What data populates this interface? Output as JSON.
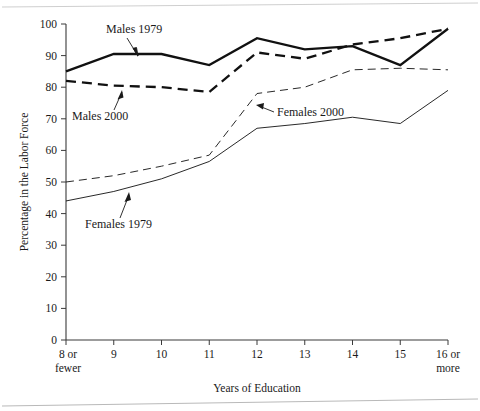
{
  "chart_data": {
    "type": "line",
    "title": "",
    "xlabel": "Years of Education",
    "ylabel": "Percentage in the Labor Force",
    "categories": [
      "8 or fewer",
      "9",
      "10",
      "11",
      "12",
      "13",
      "14",
      "15",
      "16 or more"
    ],
    "x_tick_labels_line1": [
      "8 or",
      "9",
      "10",
      "11",
      "12",
      "13",
      "14",
      "15",
      "16 or"
    ],
    "x_tick_labels_line2": [
      "fewer",
      "",
      "",
      "",
      "",
      "",
      "",
      "",
      "more"
    ],
    "y_tick_labels": [
      "0",
      "10",
      "20",
      "30",
      "40",
      "50",
      "60",
      "70",
      "80",
      "90",
      "100"
    ],
    "y_ticks": [
      0,
      10,
      20,
      30,
      40,
      50,
      60,
      70,
      80,
      90,
      100
    ],
    "ylim": [
      0,
      100
    ],
    "grid": false,
    "legend": "inline-annotations",
    "series": [
      {
        "name": "Males 1979",
        "style": "solid-thick",
        "values": [
          85,
          90.5,
          90.5,
          87,
          95.5,
          92,
          93,
          87,
          98.5
        ]
      },
      {
        "name": "Males 2000",
        "style": "dashed-thick",
        "values": [
          82,
          80.5,
          80,
          78.5,
          91,
          89,
          93.5,
          95.5,
          98.5
        ]
      },
      {
        "name": "Females 2000",
        "style": "dashed-thin",
        "values": [
          50,
          52,
          55,
          58.5,
          78,
          80,
          85.5,
          86,
          85.5
        ]
      },
      {
        "name": "Females 1979",
        "style": "solid-thin",
        "values": [
          44,
          47,
          51,
          56.5,
          67,
          68.5,
          70.5,
          68.5,
          79
        ]
      }
    ],
    "annotations": [
      {
        "text": "Males 1979",
        "series": "Males 1979"
      },
      {
        "text": "Males 2000",
        "series": "Males 2000"
      },
      {
        "text": "Females 2000",
        "series": "Females 2000"
      },
      {
        "text": "Females 1979",
        "series": "Females 1979"
      }
    ]
  }
}
